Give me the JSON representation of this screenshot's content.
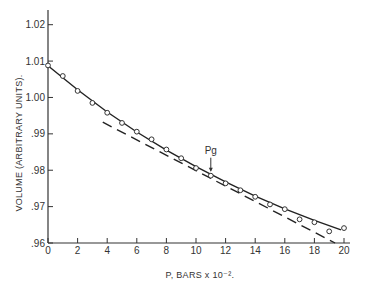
{
  "chart_data": {
    "type": "scatter",
    "title": "",
    "xlabel": "P, BARS x 10⁻².",
    "ylabel": "VOLUME (ARBITRARY UNITS).",
    "xlim": [
      0,
      20
    ],
    "ylim": [
      0.96,
      1.02
    ],
    "x_ticks": [
      0,
      2,
      4,
      6,
      8,
      10,
      12,
      14,
      16,
      18,
      20
    ],
    "x_tick_labels": [
      "0",
      "2",
      "4",
      "6",
      "8",
      "10",
      "12",
      "14",
      "16",
      "18",
      "20"
    ],
    "y_ticks": [
      0.96,
      0.97,
      0.98,
      0.99,
      1.0,
      1.01,
      1.02
    ],
    "y_tick_labels": [
      ".96",
      ".97",
      ".98",
      ".99",
      "1.00",
      "1.01",
      "1.02"
    ],
    "grid": false,
    "legend": false,
    "series": [
      {
        "name": "measured volume",
        "style": "open-circle markers",
        "x": [
          0,
          1,
          2,
          3,
          4,
          5,
          6,
          7,
          8,
          9,
          10,
          11,
          12,
          13,
          14,
          15,
          16,
          17,
          18,
          19,
          20
        ],
        "y": [
          1.0088,
          1.0059,
          1.0018,
          0.9985,
          0.9958,
          0.993,
          0.9906,
          0.9885,
          0.9857,
          0.9833,
          0.9806,
          0.9785,
          0.9764,
          0.9745,
          0.9727,
          0.9706,
          0.9693,
          0.9665,
          0.9657,
          0.9632,
          0.9641
        ]
      },
      {
        "name": "fitted curve",
        "style": "solid line",
        "x": [
          0,
          2,
          4,
          6,
          8,
          10,
          12,
          14,
          16,
          18,
          19.8
        ],
        "y": [
          1.0087,
          1.0021,
          0.996,
          0.9905,
          0.9855,
          0.981,
          0.9768,
          0.9729,
          0.9694,
          0.9662,
          0.9636
        ]
      },
      {
        "name": "linear extrapolation",
        "style": "dashed line",
        "x": [
          3.7,
          19.4
        ],
        "y": [
          0.9932,
          0.96
        ]
      }
    ],
    "annotations": [
      {
        "text": "Pg",
        "x": 11,
        "y": 0.9785,
        "arrow": "down"
      }
    ]
  }
}
